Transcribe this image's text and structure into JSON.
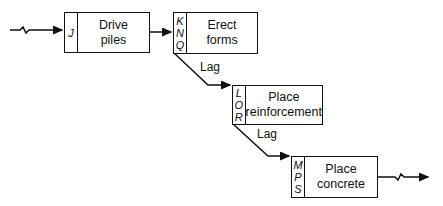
{
  "activities": [
    {
      "id": "drive-piles",
      "label": "Drive\npiles",
      "codes": [
        "J"
      ]
    },
    {
      "id": "erect-forms",
      "label": "Erect\nforms",
      "codes": [
        "K",
        "N",
        "Q"
      ]
    },
    {
      "id": "place-reinforcement",
      "label": "Place\nreinforcement",
      "codes": [
        "L",
        "O",
        "R"
      ]
    },
    {
      "id": "place-concrete",
      "label": "Place\nconcrete",
      "codes": [
        "M",
        "P",
        "S"
      ]
    }
  ],
  "lags": [
    {
      "label": "Lag"
    },
    {
      "label": "Lag"
    }
  ]
}
